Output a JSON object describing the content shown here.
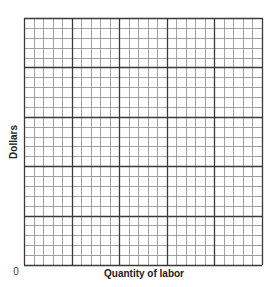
{
  "chart_data": {
    "type": "scatter",
    "title": "",
    "xlabel": "Quantity of labor",
    "ylabel": "Dollars",
    "origin_label": "0",
    "grid": true,
    "grid_spec": {
      "columns": 25,
      "rows": 25,
      "major_every": 5
    },
    "series": [],
    "colors": {
      "minor_grid": "#8a8a8a",
      "major_grid": "#3a3a3a",
      "text": "#222222"
    }
  }
}
